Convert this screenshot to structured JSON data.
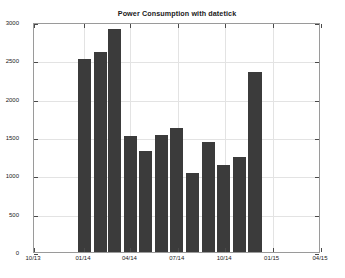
{
  "chart_data": {
    "type": "bar",
    "title": "Power Consumption with datetick",
    "xlabel": "",
    "ylabel": "",
    "grid": true,
    "legend": false,
    "ylim": [
      0,
      3000
    ],
    "yticks": [
      0,
      500,
      1000,
      1500,
      2000,
      2500,
      3000
    ],
    "ytick_labels": [
      "0",
      "500",
      "1000",
      "1500",
      "2000",
      "2500",
      "3000"
    ],
    "xtick_labels": [
      "10/13",
      "01/14",
      "04/14",
      "07/14",
      "10/14",
      "01/15",
      "04/15"
    ],
    "xtick_positions_frac": [
      0.0,
      0.1742,
      0.3359,
      0.5009,
      0.6661,
      0.8312,
      1.0
    ],
    "bar_color": "#3b3b3b",
    "categories": [
      "01/14",
      "02/14",
      "03/14",
      "04/14",
      "05/14",
      "06/14",
      "07/14",
      "08/14",
      "09/14",
      "10/14",
      "11/14",
      "12/14"
    ],
    "values": [
      2520,
      2610,
      2910,
      1515,
      1320,
      1525,
      1620,
      1025,
      1435,
      1135,
      1240,
      2345
    ],
    "bars": [
      {
        "label": "01/14",
        "value": 2520,
        "x_frac": 0.1755
      },
      {
        "label": "02/14",
        "value": 2610,
        "x_frac": 0.2305
      },
      {
        "label": "03/14",
        "value": 2910,
        "x_frac": 0.28
      },
      {
        "label": "04/14",
        "value": 1515,
        "x_frac": 0.335
      },
      {
        "label": "05/14",
        "value": 1320,
        "x_frac": 0.3885
      },
      {
        "label": "06/14",
        "value": 1525,
        "x_frac": 0.444
      },
      {
        "label": "07/14",
        "value": 1620,
        "x_frac": 0.4975
      },
      {
        "label": "08/14",
        "value": 1025,
        "x_frac": 0.553
      },
      {
        "label": "09/14",
        "value": 1435,
        "x_frac": 0.608
      },
      {
        "label": "10/14",
        "value": 1135,
        "x_frac": 0.6615
      },
      {
        "label": "11/14",
        "value": 1240,
        "x_frac": 0.7165
      },
      {
        "label": "12/14",
        "value": 2345,
        "x_frac": 0.77
      }
    ],
    "bar_width_frac": 0.0455
  }
}
